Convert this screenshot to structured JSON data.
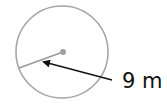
{
  "diagram": {
    "shape": "circle",
    "radius_label": "9 m",
    "colors": {
      "circle_stroke": "#a6a6a6",
      "radius_line": "#999999",
      "center_dot": "#a0a0a0",
      "arrow": "#111111",
      "label": "#111111"
    }
  }
}
